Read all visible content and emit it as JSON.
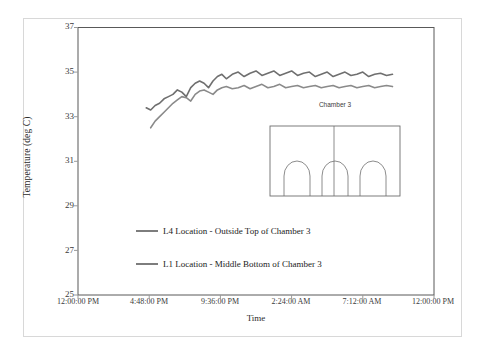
{
  "chart_data": {
    "type": "line",
    "title": "",
    "xlabel": "Time",
    "ylabel": "Temperature (deg C)",
    "ylim": [
      25,
      37
    ],
    "yticks": [
      25,
      27,
      29,
      31,
      33,
      35,
      37
    ],
    "xticks": [
      "12:00:00 PM",
      "4:48:00 PM",
      "9:36:00 PM",
      "2:24:00 AM",
      "7:12:00 AM",
      "12:00:00 PM"
    ],
    "grid": false,
    "legend_position": "lower-center-inside",
    "line_color": "#7d7d7d",
    "series": [
      {
        "name": "L4 Location - Outside Top of Chamber 3",
        "color": "#6f6f6f",
        "x_hours": [
          4.6,
          4.9,
          5.2,
          5.5,
          5.8,
          6.1,
          6.4,
          6.7,
          7.0,
          7.3,
          7.6,
          7.9,
          8.2,
          8.5,
          8.8,
          9.1,
          9.4,
          9.7,
          10.0,
          10.4,
          10.8,
          11.2,
          11.6,
          12.0,
          12.4,
          12.8,
          13.2,
          13.6,
          14.0,
          14.4,
          14.8,
          15.2,
          15.6,
          16.0,
          16.4,
          16.8,
          17.2,
          17.6,
          18.0,
          18.4,
          18.8,
          19.2,
          19.6,
          20.0,
          20.4,
          20.8,
          21.2
        ],
        "values": [
          33.4,
          33.3,
          33.5,
          33.6,
          33.8,
          33.9,
          34.0,
          34.2,
          34.1,
          33.9,
          34.3,
          34.5,
          34.6,
          34.5,
          34.3,
          34.6,
          34.8,
          34.9,
          34.7,
          34.9,
          35.0,
          34.8,
          34.95,
          35.05,
          34.85,
          34.95,
          35.05,
          34.85,
          34.95,
          35.05,
          34.85,
          34.95,
          35.0,
          34.8,
          34.9,
          35.0,
          34.8,
          34.9,
          35.0,
          34.85,
          34.9,
          35.0,
          34.8,
          34.9,
          34.95,
          34.85,
          34.9
        ]
      },
      {
        "name": "L1 Location - Middle Bottom of Chamber 3",
        "color": "#8a8a8a",
        "x_hours": [
          4.9,
          5.2,
          5.5,
          5.8,
          6.1,
          6.4,
          6.7,
          7.0,
          7.3,
          7.6,
          7.9,
          8.2,
          8.5,
          8.8,
          9.1,
          9.4,
          9.7,
          10.0,
          10.4,
          10.8,
          11.2,
          11.6,
          12.0,
          12.4,
          12.8,
          13.2,
          13.6,
          14.0,
          14.4,
          14.8,
          15.2,
          15.6,
          16.0,
          16.4,
          16.8,
          17.2,
          17.6,
          18.0,
          18.4,
          18.8,
          19.2,
          19.6,
          20.0,
          20.4,
          20.8,
          21.2
        ],
        "values": [
          32.5,
          32.8,
          33.0,
          33.2,
          33.4,
          33.6,
          33.75,
          33.9,
          33.85,
          33.7,
          34.0,
          34.15,
          34.2,
          34.1,
          34.0,
          34.2,
          34.3,
          34.35,
          34.25,
          34.3,
          34.4,
          34.25,
          34.35,
          34.45,
          34.3,
          34.35,
          34.45,
          34.3,
          34.35,
          34.4,
          34.3,
          34.35,
          34.4,
          34.3,
          34.35,
          34.4,
          34.3,
          34.35,
          34.4,
          34.3,
          34.35,
          34.4,
          34.3,
          34.35,
          34.4,
          34.35
        ]
      }
    ]
  },
  "axes": {
    "y_title": "Temperature (deg C)",
    "x_title": "Time",
    "y_ticks": [
      "37",
      "35",
      "33",
      "31",
      "29",
      "27",
      "25"
    ],
    "x_ticks": [
      "12:00:00 PM",
      "4:48:00 PM",
      "9:36:00 PM",
      "2:24:00 AM",
      "7:12:00 AM",
      "12:00:00 PM"
    ]
  },
  "legend": {
    "entries": [
      {
        "label": "L4 Location - Outside Top of Chamber 3"
      },
      {
        "label": "L1 Location - Middle Bottom of Chamber 3"
      }
    ]
  },
  "inset": {
    "title": "Chamber 3",
    "labels": [
      {
        "text": "L1"
      },
      {
        "text": "L4^"
      }
    ]
  }
}
